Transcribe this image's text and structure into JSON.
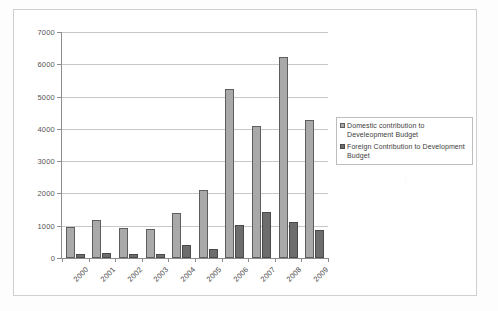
{
  "chart_data": {
    "type": "bar",
    "title": "",
    "xlabel": "",
    "ylabel": "",
    "ylim": [
      0,
      7000
    ],
    "yticks": [
      0,
      1000,
      2000,
      3000,
      4000,
      5000,
      6000,
      7000
    ],
    "ytick_labels": [
      "0",
      "1000",
      "2000",
      "3000",
      "4000",
      "5000",
      "6000",
      "7000"
    ],
    "grid": true,
    "legend_position": "right",
    "categories": [
      "2000",
      "2001",
      "2002",
      "2003",
      "2004",
      "2005",
      "2006",
      "2007",
      "2008",
      "2009"
    ],
    "series": [
      {
        "name": "Domestic contribution to Develeopment Budget",
        "color": "#a9a9a9",
        "values": [
          975,
          1190,
          925,
          905,
          1395,
          2115,
          5245,
          4095,
          6240,
          4275
        ]
      },
      {
        "name": "Foreign Contribution to Development Budget",
        "color": "#6d6d6d",
        "values": [
          110,
          155,
          125,
          120,
          390,
          280,
          1015,
          1440,
          1115,
          880
        ]
      }
    ]
  },
  "legend": {
    "items": [
      {
        "label": "Domestic contribution to Develeopment Budget",
        "swatch": "domestic"
      },
      {
        "label": "Foreign Contribution to Development Budget",
        "swatch": "foreign"
      }
    ]
  },
  "scan_mark": "⁚"
}
